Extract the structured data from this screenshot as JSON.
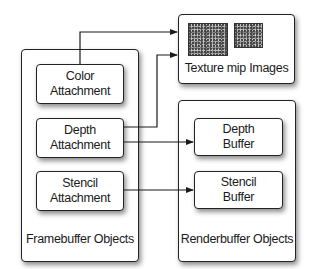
{
  "diagram": {
    "framebuffer": {
      "label": "Framebuffer Objects",
      "attachments": [
        {
          "line1": "Color",
          "line2": "Attachment"
        },
        {
          "line1": "Depth",
          "line2": "Attachment"
        },
        {
          "line1": "Stencil",
          "line2": "Attachment"
        }
      ]
    },
    "texture": {
      "label": "Texture mip Images",
      "images": [
        "texture-image-large",
        "texture-image-small"
      ]
    },
    "renderbuffer": {
      "label": "Renderbuffer Objects",
      "buffers": [
        {
          "line1": "Depth",
          "line2": "Buffer"
        },
        {
          "line1": "Stencil",
          "line2": "Buffer"
        }
      ]
    },
    "connections": [
      {
        "from": "Color Attachment",
        "to": "Texture mip Images"
      },
      {
        "from": "Depth Attachment",
        "to": "Texture mip Images"
      },
      {
        "from": "Depth Attachment",
        "to": "Depth Buffer"
      },
      {
        "from": "Stencil Attachment",
        "to": "Stencil Buffer"
      }
    ],
    "colors": {
      "line": "#1a1a1a",
      "box_border": "#222222",
      "background": "#ffffff"
    }
  }
}
